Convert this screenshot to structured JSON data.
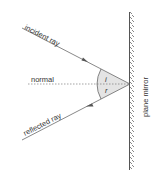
{
  "diagram": {
    "labels": {
      "incident": "incident ray",
      "normal": "normal",
      "reflected": "reflected ray",
      "mirror": "plane mirror",
      "angle_i": "i",
      "angle_r": "r"
    },
    "colors": {
      "line": "#555555",
      "mirror_fill": "#d8d8d8",
      "angle_fill": "#e4e4e4"
    }
  }
}
